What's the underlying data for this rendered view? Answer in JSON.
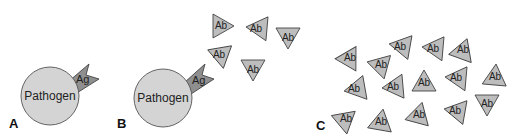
{
  "figure": {
    "panels": [
      {
        "id": "A",
        "label": "A",
        "pathogen_label": "Pathogen",
        "antigen_label": "Ag"
      },
      {
        "id": "B",
        "label": "B",
        "pathogen_label": "Pathogen",
        "antigen_label": "Ag",
        "antibody_label": "Ab",
        "antibody_count": 5
      },
      {
        "id": "C",
        "label": "C",
        "antibody_label": "Ab",
        "antibody_count": 15
      }
    ],
    "colors": {
      "pathogen_fill": "#d4d4d4",
      "antigen_fill": "#8f8f8f",
      "antibody_fill": "#bdbdbd",
      "stroke": "#444444",
      "text": "#222222"
    }
  }
}
